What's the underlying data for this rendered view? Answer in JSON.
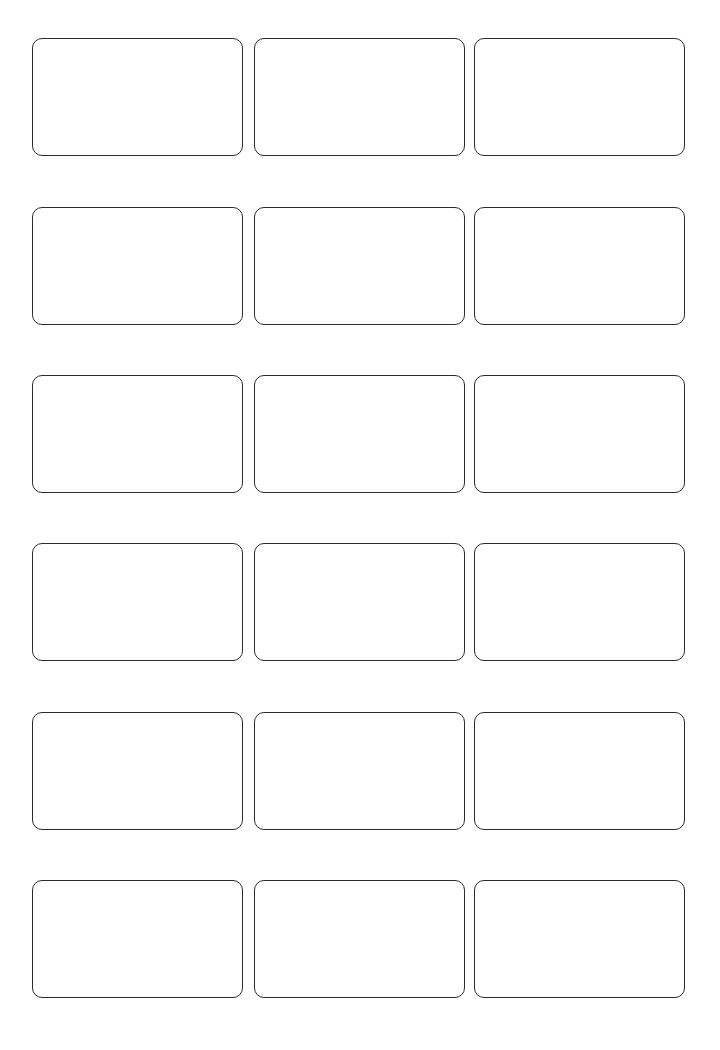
{
  "sheet": {
    "title": "Blank Label Template Sheet",
    "background_color": "#ffffff",
    "width": 720,
    "height": 1050,
    "rows": 6,
    "columns": 3,
    "total_labels": 18
  },
  "label_style": {
    "border_color": "#2b2b2b",
    "border_width_px": 1.6,
    "corner_radius_px": 10,
    "fill_color": "#ffffff",
    "width_px": 211,
    "height_px": 118,
    "column_gap_px": 11,
    "row_gap_px": 51
  },
  "grid": {
    "column_left_px": [
      32,
      254,
      474
    ],
    "row_top_px": [
      38,
      207,
      375,
      543,
      712,
      880
    ]
  },
  "labels": [
    {
      "id": "r1c1",
      "row": 1,
      "column": 1,
      "text": ""
    },
    {
      "id": "r1c2",
      "row": 1,
      "column": 2,
      "text": ""
    },
    {
      "id": "r1c3",
      "row": 1,
      "column": 3,
      "text": ""
    },
    {
      "id": "r2c1",
      "row": 2,
      "column": 1,
      "text": ""
    },
    {
      "id": "r2c2",
      "row": 2,
      "column": 2,
      "text": ""
    },
    {
      "id": "r2c3",
      "row": 2,
      "column": 3,
      "text": ""
    },
    {
      "id": "r3c1",
      "row": 3,
      "column": 1,
      "text": ""
    },
    {
      "id": "r3c2",
      "row": 3,
      "column": 2,
      "text": ""
    },
    {
      "id": "r3c3",
      "row": 3,
      "column": 3,
      "text": ""
    },
    {
      "id": "r4c1",
      "row": 4,
      "column": 1,
      "text": ""
    },
    {
      "id": "r4c2",
      "row": 4,
      "column": 2,
      "text": ""
    },
    {
      "id": "r4c3",
      "row": 4,
      "column": 3,
      "text": ""
    },
    {
      "id": "r5c1",
      "row": 5,
      "column": 1,
      "text": ""
    },
    {
      "id": "r5c2",
      "row": 5,
      "column": 2,
      "text": ""
    },
    {
      "id": "r5c3",
      "row": 5,
      "column": 3,
      "text": ""
    },
    {
      "id": "r6c1",
      "row": 6,
      "column": 1,
      "text": ""
    },
    {
      "id": "r6c2",
      "row": 6,
      "column": 2,
      "text": ""
    },
    {
      "id": "r6c3",
      "row": 6,
      "column": 3,
      "text": ""
    }
  ]
}
